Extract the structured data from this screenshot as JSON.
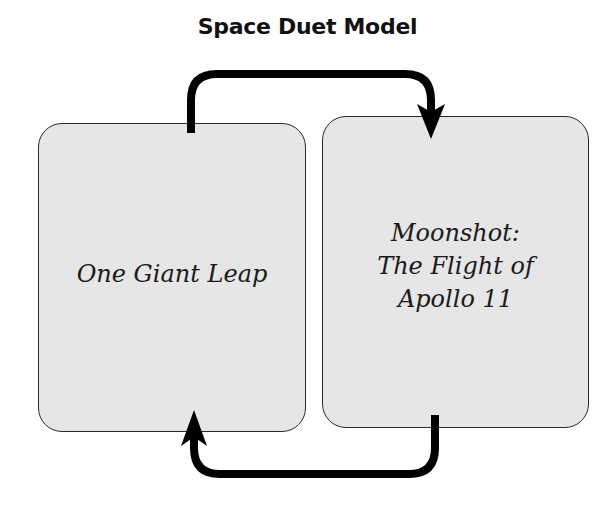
{
  "diagram": {
    "title": "Space Duet Model",
    "nodes": [
      {
        "id": "left",
        "label": "One Giant Leap"
      },
      {
        "id": "right",
        "label": "Moonshot:\nThe Flight of\nApollo 11"
      }
    ],
    "edges": [
      {
        "from": "left",
        "to": "right",
        "route": "top"
      },
      {
        "from": "right",
        "to": "left",
        "route": "bottom"
      }
    ],
    "colors": {
      "box_fill": "#e6e6e6",
      "box_border": "#2a2a2a",
      "arrow": "#000000",
      "text": "#1a1a1a"
    }
  }
}
